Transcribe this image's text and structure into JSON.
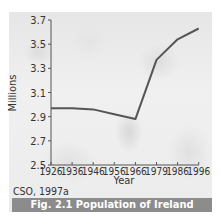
{
  "figure": {
    "caption": "Fig. 2.1 Population of Ireland",
    "source": "CSO, 1997a",
    "caption_bg_color": "#8c8c8c",
    "line_color": "#555555"
  },
  "chart_data": {
    "type": "line",
    "title": "Fig. 2.1 Population of Ireland",
    "xlabel": "Year",
    "ylabel": "Millions",
    "categories": [
      "1926",
      "1936",
      "1946",
      "1956",
      "1966",
      "1979",
      "1986",
      "1996"
    ],
    "series": [
      {
        "name": "Population of Ireland",
        "values": [
          2.97,
          2.97,
          2.96,
          2.92,
          2.88,
          3.37,
          3.54,
          3.63
        ]
      }
    ],
    "yticks": [
      "3.7",
      "3.5",
      "3.3",
      "3.1",
      "2.9",
      "2.7",
      "2.5"
    ],
    "ylim": [
      2.5,
      3.7
    ],
    "grid": false,
    "legend": "none",
    "source": "CSO, 1997a"
  }
}
